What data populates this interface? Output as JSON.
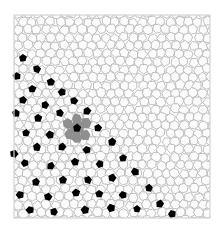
{
  "figure": {
    "frame": {
      "x": 14,
      "y": 15,
      "width": 196,
      "height": 203
    },
    "colors": {
      "background": "#ffffff",
      "cell_fill": "#fbfbfb",
      "cell_outline": "#b9b9b9",
      "black_cell": "#000000",
      "highlight_cluster": "#8f8f8f",
      "frame": "#d4d4d4"
    },
    "cell_spacing": 9.2,
    "black_cells": [
      [
        23,
        58
      ],
      [
        37,
        69
      ],
      [
        17,
        76
      ],
      [
        51,
        82
      ],
      [
        32,
        89
      ],
      [
        62,
        92
      ],
      [
        23,
        100
      ],
      [
        45,
        105
      ],
      [
        74,
        101
      ],
      [
        60,
        113
      ],
      [
        16,
        113
      ],
      [
        38,
        118
      ],
      [
        87,
        111
      ],
      [
        26,
        133
      ],
      [
        50,
        135
      ],
      [
        98,
        128
      ],
      [
        62,
        147
      ],
      [
        112,
        142
      ],
      [
        37,
        147
      ],
      [
        14,
        154
      ],
      [
        87,
        150
      ],
      [
        75,
        162
      ],
      [
        100,
        164
      ],
      [
        123,
        158
      ],
      [
        25,
        163
      ],
      [
        51,
        166
      ],
      [
        36,
        182
      ],
      [
        63,
        180
      ],
      [
        88,
        180
      ],
      [
        112,
        178
      ],
      [
        135,
        172
      ],
      [
        149,
        188
      ],
      [
        123,
        195
      ],
      [
        99,
        194
      ],
      [
        76,
        193
      ],
      [
        20,
        195
      ],
      [
        48,
        197
      ],
      [
        30,
        210
      ],
      [
        54,
        212
      ],
      [
        111,
        208
      ],
      [
        137,
        209
      ],
      [
        160,
        204
      ],
      [
        85,
        210
      ],
      [
        172,
        214
      ]
    ],
    "highlight_cluster": {
      "center": [
        77,
        128
      ],
      "neighbors": [
        [
          68,
          124
        ],
        [
          86,
          123
        ],
        [
          70,
          134
        ],
        [
          85,
          135
        ],
        [
          77,
          119
        ],
        [
          77,
          138
        ]
      ]
    }
  }
}
